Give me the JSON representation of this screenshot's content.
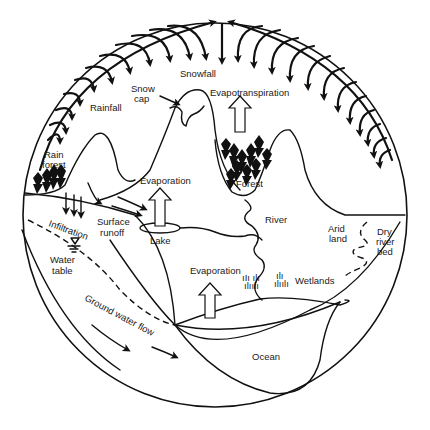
{
  "diagram": {
    "labels": {
      "snowfall": "Snowfall",
      "snow_cap_1": "Snow",
      "snow_cap_2": "cap",
      "rainfall": "Rainfall",
      "evapotranspiration": "Evapotranspiration",
      "rain_forest_1": "Rain",
      "rain_forest_2": "forest",
      "forest": "Forest",
      "evaporation_lake": "Evaporation",
      "evaporation_ocean": "Evaporation",
      "infiltration": "Infiltration",
      "surface_runoff_1": "Surface",
      "surface_runoff_2": "runoff",
      "lake": "Lake",
      "river": "River",
      "arid_land_1": "Arid",
      "arid_land_2": "land",
      "dry_river_bed_1": "Dry",
      "dry_river_bed_2": "river",
      "dry_river_bed_3": "bed",
      "water_table_1": "Water",
      "water_table_2": "table",
      "wetlands": "Wetlands",
      "ground_water_flow": "Ground water flow",
      "ocean": "Ocean"
    },
    "colors": {
      "line": "#111111",
      "background": "#ffffff"
    }
  }
}
